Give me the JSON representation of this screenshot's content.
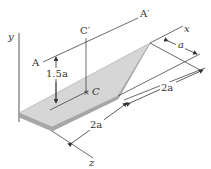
{
  "diagram": {
    "axes": {
      "x": "x",
      "y": "y",
      "z": "z"
    },
    "points": {
      "A": "A",
      "A_prime": "A′",
      "C": "C",
      "C_prime": "C′"
    },
    "dimensions": {
      "height_C": "1.5a",
      "width_top": "a",
      "length_right": "2a",
      "length_front": "2a"
    },
    "colors": {
      "plate_top": "#d4d4d4",
      "plate_edge": "#a8a8a8",
      "line": "#444444"
    }
  }
}
